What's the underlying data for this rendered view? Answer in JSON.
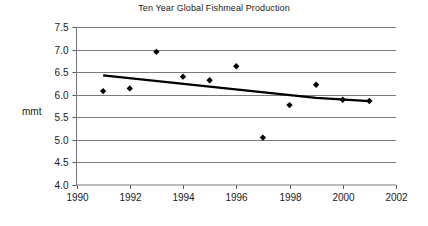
{
  "chart_data": {
    "type": "scatter",
    "title": "Ten Year Global Fishmeal Production",
    "xlabel": "",
    "ylabel": "mmt",
    "xlim": [
      1990,
      2002
    ],
    "ylim": [
      4.0,
      7.5
    ],
    "grid": true,
    "legend": "none",
    "x_ticks": [
      "1990",
      "1992",
      "1994",
      "1996",
      "1998",
      "2000",
      "2002"
    ],
    "y_ticks": [
      "4.0",
      "4.5",
      "5.0",
      "5.5",
      "6.0",
      "6.5",
      "7.0",
      "7.5"
    ],
    "x": [
      1991,
      1992,
      1993,
      1994,
      1995,
      1996,
      1997,
      1998,
      1999,
      2000,
      2001
    ],
    "values": [
      6.08,
      6.14,
      6.95,
      6.4,
      6.32,
      6.63,
      5.05,
      5.77,
      6.22,
      5.89,
      5.86
    ],
    "series": [
      {
        "name": "Global Fishmeal Production",
        "marker": "diamond",
        "color": "#000000",
        "x": [
          1991,
          1992,
          1993,
          1994,
          1995,
          1996,
          1997,
          1998,
          1999,
          2000,
          2001
        ],
        "values": [
          6.08,
          6.14,
          6.95,
          6.4,
          6.32,
          6.63,
          5.05,
          5.77,
          6.22,
          5.89,
          5.86
        ]
      },
      {
        "name": "Trend",
        "type": "line",
        "color": "#000000",
        "x": [
          1991,
          1999,
          2001
        ],
        "values": [
          6.43,
          5.93,
          5.86
        ]
      }
    ]
  },
  "chart": {
    "title": "Ten Year Global Fishmeal Production",
    "y_axis_label": "mmt"
  }
}
